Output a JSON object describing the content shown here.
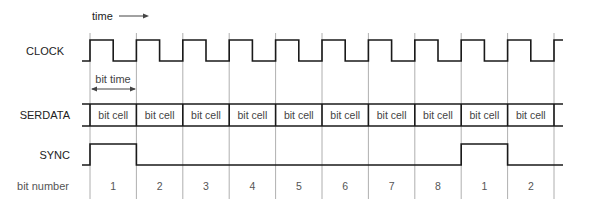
{
  "diagram": {
    "time_label": "time",
    "bit_time_label": "bit time",
    "signals": {
      "clock": "CLOCK",
      "serdata": "SERDATA",
      "sync": "SYNC",
      "bit_number": "bit number"
    },
    "cell_label": "bit cell",
    "bit_numbers": [
      "1",
      "2",
      "3",
      "4",
      "5",
      "6",
      "7",
      "8",
      "1",
      "2"
    ],
    "sync_high_cells": [
      0,
      8
    ],
    "colors": {
      "wave": "#1a1a1a",
      "grid": "#9a9a9a",
      "text": "#222222"
    }
  }
}
